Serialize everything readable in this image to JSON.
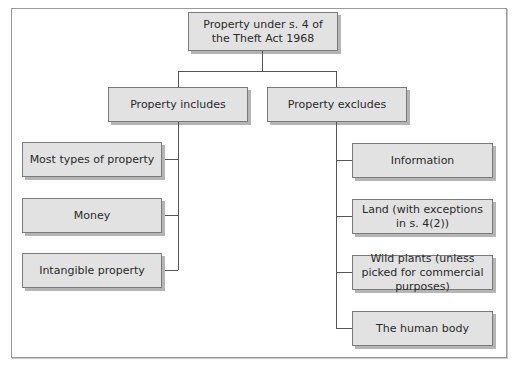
{
  "diagram": {
    "type": "hierarchy",
    "root": {
      "label": "Property under s. 4 of the Theft Act 1968"
    },
    "branches": [
      {
        "label": "Property includes",
        "children": [
          "Most types of property",
          "Money",
          "Intangible property"
        ]
      },
      {
        "label": "Property excludes",
        "children": [
          "Information",
          "Land (with exceptions in s. 4(2))",
          "Wild plants (unless picked for commercial  purposes)",
          "The human body"
        ]
      }
    ],
    "colors": {
      "box_fill": "#e2e2e2",
      "box_border": "#7a7a7a",
      "box_shadow": "#b5b5b5",
      "connector": "#555555",
      "frame": "#9a9a9a"
    }
  }
}
